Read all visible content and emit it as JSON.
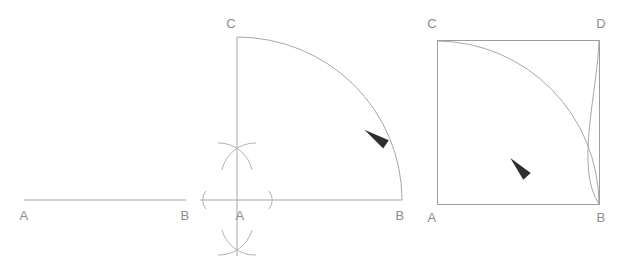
{
  "figure": {
    "background_color": "#ffffff",
    "line_color": "#a8a8a8",
    "construction_mark_color": "#b3b3b3",
    "label_color": "#8d8d8d",
    "arrow_color": "#2e2e2e",
    "panel_count": 3
  },
  "panels": [
    {
      "id": "panel-1",
      "name": "given-segment",
      "caption": "",
      "labels": [
        {
          "text": "A",
          "x": 24,
          "y": 220,
          "anchor": "middle"
        },
        {
          "text": "B",
          "x": 185,
          "y": 220,
          "anchor": "middle"
        }
      ],
      "segments": [
        {
          "name": "segment-ab",
          "x1": 24,
          "y1": 200,
          "x2": 186,
          "y2": 200
        }
      ]
    },
    {
      "id": "panel-2",
      "name": "perpendicular-and-arc",
      "caption": "",
      "labels": [
        {
          "text": "C",
          "x": 231,
          "y": 28,
          "anchor": "middle"
        },
        {
          "text": "A",
          "x": 240,
          "y": 220,
          "anchor": "middle"
        },
        {
          "text": "B",
          "x": 400,
          "y": 220,
          "anchor": "middle"
        }
      ],
      "segments": [
        {
          "name": "baseline-ab",
          "x1": 200,
          "y1": 200,
          "x2": 402,
          "y2": 200
        },
        {
          "name": "perpendicular-line",
          "x1": 237,
          "y1": 37,
          "x2": 237,
          "y2": 256
        }
      ],
      "arcs": [
        {
          "name": "quarter-arc-c-to-b",
          "from_x": 237,
          "from_y": 37,
          "to_x": 402,
          "to_y": 200,
          "rx": 165,
          "ry": 163,
          "sweep": 1
        }
      ],
      "construction_marks": [
        {
          "name": "left-compass-mark",
          "type": "paren-left",
          "x": 203,
          "y": 200
        },
        {
          "name": "right-compass-mark",
          "type": "paren-right",
          "x": 272,
          "y": 200
        },
        {
          "name": "upper-arc-cross",
          "type": "cross-arcs",
          "x": 237,
          "y": 153
        },
        {
          "name": "lower-arc-cross",
          "type": "cross-arcs",
          "x": 237,
          "y": 245
        }
      ],
      "arrowheads": [
        {
          "name": "arrow-on-arc",
          "x": 381,
          "y": 140,
          "angle": 56
        }
      ]
    },
    {
      "id": "panel-3",
      "name": "completed-square",
      "caption": "",
      "labels": [
        {
          "text": "C",
          "x": 432,
          "y": 28,
          "anchor": "middle"
        },
        {
          "text": "D",
          "x": 601,
          "y": 28,
          "anchor": "middle"
        },
        {
          "text": "A",
          "x": 432,
          "y": 222,
          "anchor": "middle"
        },
        {
          "text": "B",
          "x": 601,
          "y": 222,
          "anchor": "middle"
        }
      ],
      "square": {
        "name": "square-acdb",
        "left": 437,
        "top": 40,
        "right": 600,
        "bottom": 205
      },
      "arcs": [
        {
          "name": "arc-from-c-to-b",
          "from_x": 438,
          "from_y": 41,
          "to_x": 599,
          "to_y": 204,
          "rx": 162,
          "ry": 163,
          "sweep": 1
        },
        {
          "name": "arc-from-d-to-b",
          "from_x": 599,
          "from_y": 41,
          "to_x": 599,
          "to_y": 204,
          "rx": 120,
          "ry": 90,
          "sweep": 0
        }
      ],
      "arrowheads": [
        {
          "name": "arrow-on-arc",
          "x": 521,
          "y": 173,
          "angle": -40
        }
      ],
      "intersection_point": {
        "name": "arc-intersection",
        "x": 566,
        "y": 120
      }
    }
  ],
  "geometry_notes": {
    "vertex_labels": [
      "A",
      "B",
      "C",
      "D"
    ],
    "segment_label_order": "A-B left to right, C above A, D above B"
  }
}
